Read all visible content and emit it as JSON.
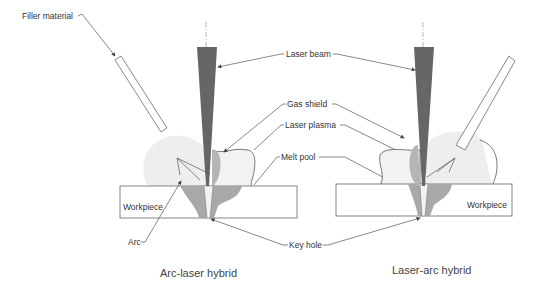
{
  "diagram": {
    "left_panel": {
      "caption": "Arc-laser hybrid",
      "labels": {
        "filler_material": "Filler material",
        "workpiece": "Workpiece",
        "arc": "Arc"
      }
    },
    "right_panel": {
      "caption": "Laser-arc hybrid",
      "labels": {
        "workpiece": "Workpiece"
      }
    },
    "shared_labels": {
      "laser_beam": "Laser beam",
      "gas_shield": "Gas shield",
      "laser_plasma": "Laser plasma",
      "melt_pool": "Melt pool",
      "key_hole": "Key hole"
    },
    "colors": {
      "laser_beam": "#666666",
      "gas_shield": "#eeeeee",
      "laser_plasma": "#b5b5b5",
      "melt_pool": "#a8a8a8",
      "key_hole": "#f2f2f2",
      "outline": "#555555"
    }
  }
}
